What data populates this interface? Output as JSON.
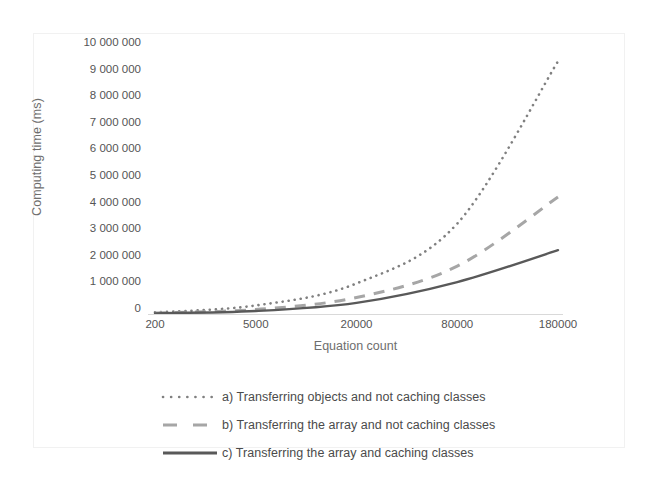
{
  "chart_data": {
    "type": "line",
    "title": "",
    "xlabel": "Equation count",
    "ylabel": "Computing time (ms)",
    "categories": [
      "200",
      "5000",
      "20000",
      "80000",
      "180000"
    ],
    "x_tick_labels": [
      "200",
      "5000",
      "20000",
      "80000",
      "180000"
    ],
    "y_tick_labels": [
      "10 000 000",
      "9 000 000",
      "8 000 000",
      "7 000 000",
      "6 000 000",
      "5 000 000",
      "4 000 000",
      "3 000 000",
      "2 000 000",
      "1 000 000",
      "0"
    ],
    "ylim": [
      0,
      10000000
    ],
    "y_tick_step": 1000000,
    "grid": false,
    "legend_position": "bottom",
    "series": [
      {
        "name": "a) Transferring objects and not caching classes",
        "style": "dotted",
        "color": "#808080",
        "values": [
          60000,
          320000,
          1150000,
          3400000,
          9500000
        ]
      },
      {
        "name": "b) Transferring the array and not caching classes",
        "style": "dashed",
        "color": "#a6a6a6",
        "values": [
          40000,
          170000,
          620000,
          1800000,
          4400000
        ]
      },
      {
        "name": "c) Transferring the array and caching classes",
        "style": "solid",
        "color": "#595959",
        "values": [
          25000,
          110000,
          420000,
          1200000,
          2400000
        ]
      }
    ]
  },
  "legend": {
    "items": [
      {
        "label": "a) Transferring objects and not caching classes",
        "style": "dotted",
        "color": "#808080"
      },
      {
        "label": "b) Transferring the array and not caching classes",
        "style": "dashed",
        "color": "#a6a6a6"
      },
      {
        "label": "c) Transferring the array and caching classes",
        "style": "solid",
        "color": "#595959"
      }
    ]
  }
}
